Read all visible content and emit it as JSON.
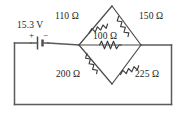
{
  "figure": {
    "frame_color": "#5a5a5a",
    "label_color": "#1c1c1c"
  },
  "source": {
    "label": "15.3 V",
    "voltage": 15.3,
    "unit": "V",
    "plus_sign": "+",
    "minus_sign": "−",
    "type": "battery"
  },
  "resistors": {
    "top_left": {
      "label": "110 Ω",
      "value": 110,
      "unit": "Ω"
    },
    "top_right": {
      "label": "150 Ω",
      "value": 150,
      "unit": "Ω"
    },
    "bridge": {
      "label": "100 Ω",
      "value": 100,
      "unit": "Ω"
    },
    "bottom_left": {
      "label": "200 Ω",
      "value": 200,
      "unit": "Ω"
    },
    "bottom_right": {
      "label": "225 Ω",
      "value": 225,
      "unit": "Ω"
    }
  }
}
